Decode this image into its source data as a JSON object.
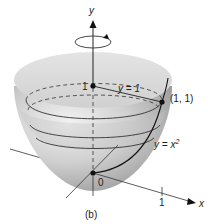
{
  "figure": {
    "caption": "(b)",
    "axes": {
      "y_label": "y",
      "x_label": "x",
      "origin_label": "0",
      "x_tick": "1",
      "y_tick": "1"
    },
    "annotations": {
      "line_label": "y = 1",
      "point_label": "(1, 1)",
      "curve_label_base": "y = x",
      "curve_label_exp": "2"
    },
    "rotation_indicator": "rotation-about-y-axis",
    "colors": {
      "surface_light": "#e6e6e6",
      "surface_mid": "#bdbdbd",
      "surface_dark": "#8a8a8a",
      "line": "#1a1a1a"
    }
  }
}
